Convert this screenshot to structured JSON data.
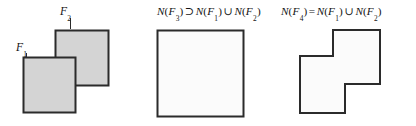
{
  "figure": {
    "width": 416,
    "height": 126,
    "background": "#ffffff",
    "stroke_color": "#2b2b2b",
    "fill_gray": "#d4d4d4",
    "fill_white": "#fbfbfb"
  },
  "panels": [
    {
      "id": "overlap",
      "name": "overlapping-squares-panel",
      "labels": {
        "f2": {
          "base": "F",
          "sub": "2"
        },
        "f1": {
          "base": "F",
          "sub": "1"
        }
      },
      "shapes": [
        {
          "name": "square-f2",
          "kind": "square",
          "x": 55,
          "y": 30,
          "w": 53,
          "h": 55,
          "fill": "#d4d4d4"
        },
        {
          "name": "square-f1",
          "kind": "square",
          "x": 23,
          "y": 57,
          "w": 52,
          "h": 55,
          "fill": "#d4d4d4"
        }
      ]
    },
    {
      "id": "superset",
      "name": "superset-square-panel",
      "caption": {
        "tokens": [
          {
            "t": "N",
            "style": "var"
          },
          {
            "t": "(",
            "style": "paren"
          },
          {
            "t": "F",
            "style": "var",
            "sub": "3"
          },
          {
            "t": ")",
            "style": "paren"
          },
          {
            "t": "⊃",
            "style": "op"
          },
          {
            "t": "N",
            "style": "var"
          },
          {
            "t": "(",
            "style": "paren"
          },
          {
            "t": "F",
            "style": "var",
            "sub": "1"
          },
          {
            "t": ")",
            "style": "paren"
          },
          {
            "t": "∪",
            "style": "op"
          },
          {
            "t": "N",
            "style": "var"
          },
          {
            "t": "(",
            "style": "paren"
          },
          {
            "t": "F",
            "style": "var",
            "sub": "2"
          },
          {
            "t": ")",
            "style": "paren"
          }
        ],
        "plain": "N(F3) ⊃ N(F1) ∪ N(F2)"
      },
      "shapes": [
        {
          "name": "square-n-f3",
          "kind": "square",
          "x": 17,
          "y": 30,
          "w": 86,
          "h": 86,
          "fill": "#fbfbfb"
        }
      ]
    },
    {
      "id": "equal",
      "name": "union-polygon-panel",
      "caption": {
        "tokens": [
          {
            "t": "N",
            "style": "var"
          },
          {
            "t": "(",
            "style": "paren"
          },
          {
            "t": "F",
            "style": "var",
            "sub": "4"
          },
          {
            "t": ")",
            "style": "paren"
          },
          {
            "t": "=",
            "style": "op"
          },
          {
            "t": "N",
            "style": "var"
          },
          {
            "t": "(",
            "style": "paren"
          },
          {
            "t": "F",
            "style": "var",
            "sub": "1"
          },
          {
            "t": ")",
            "style": "paren"
          },
          {
            "t": "∪",
            "style": "op"
          },
          {
            "t": "N",
            "style": "var"
          },
          {
            "t": "(",
            "style": "paren"
          },
          {
            "t": "F",
            "style": "var",
            "sub": "2"
          },
          {
            "t": ")",
            "style": "paren"
          }
        ],
        "plain": "N(F4) = N(F1) ∪ N(F2)"
      },
      "shapes": [
        {
          "name": "step-polygon-n-f4",
          "kind": "polygon",
          "points": "57,30 104,30 104,84 69,84 69,113 24,113 24,56 57,56",
          "fill": "#fbfbfb"
        }
      ]
    }
  ]
}
